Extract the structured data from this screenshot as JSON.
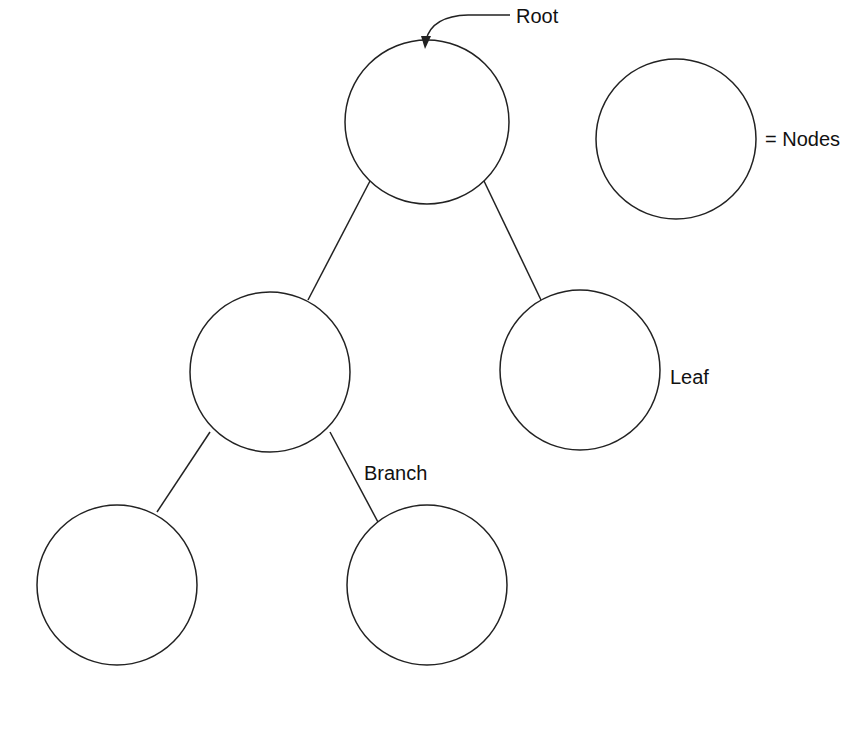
{
  "diagram": {
    "type": "tree",
    "labels": {
      "root": "Root",
      "nodes_legend": "= Nodes",
      "leaf": "Leaf",
      "branch": "Branch"
    },
    "stroke_color": "#222222",
    "background": "#ffffff",
    "nodes": [
      {
        "id": "root",
        "cx": 427,
        "cy": 122,
        "r": 82
      },
      {
        "id": "left-child",
        "cx": 270,
        "cy": 372,
        "r": 80
      },
      {
        "id": "right-child-leaf",
        "cx": 580,
        "cy": 370,
        "r": 80
      },
      {
        "id": "left-left-grandchild",
        "cx": 117,
        "cy": 585,
        "r": 80
      },
      {
        "id": "left-right-grandchild",
        "cx": 427,
        "cy": 585,
        "r": 80
      },
      {
        "id": "legend-node",
        "cx": 676,
        "cy": 139,
        "r": 80
      }
    ],
    "edges": [
      {
        "from": "root",
        "to": "left-child"
      },
      {
        "from": "root",
        "to": "right-child-leaf"
      },
      {
        "from": "left-child",
        "to": "left-left-grandchild"
      },
      {
        "from": "left-child",
        "to": "left-right-grandchild"
      }
    ]
  }
}
